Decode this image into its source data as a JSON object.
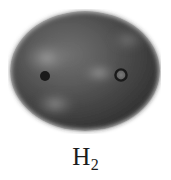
{
  "figure": {
    "caption": "H",
    "caption_subscript": "2",
    "background_color": "#ffffff",
    "label_color": "#1c1c1c"
  },
  "diagram": {
    "type": "electron-density-cloud",
    "title": "H2",
    "shape": "ellipse",
    "shape_center": {
      "x": 85,
      "y": 71
    },
    "shape_radius_x": 77,
    "shape_radius_y": 62,
    "fill_dark_color": "#1a1a1a",
    "fill_mid_color": "#4a4a4a",
    "fill_light_color": "#a8a8a8",
    "edge_softness": "blurred",
    "nuclei": [
      {
        "name": "hydrogen-nucleus-left",
        "label": "H",
        "cx": 45,
        "cy": 76,
        "radius": 5,
        "style": "filled-dot",
        "color": "#000000"
      },
      {
        "name": "hydrogen-nucleus-right",
        "label": "H",
        "cx": 121,
        "cy": 75,
        "radius": 5.5,
        "style": "ring",
        "color": "#000000",
        "inner_color": "#6e6e6e"
      }
    ],
    "highlights": [
      {
        "name": "upper-left-highlight",
        "cx": 47,
        "cy": 58,
        "rx": 22,
        "ry": 15,
        "intensity": "#b4b4b4"
      },
      {
        "name": "central-bond-highlight",
        "cx": 99,
        "cy": 73,
        "rx": 17,
        "ry": 9,
        "intensity": "#b0b0b0"
      },
      {
        "name": "lower-left-highlight",
        "cx": 55,
        "cy": 104,
        "rx": 20,
        "ry": 12,
        "intensity": "#a6a6a6"
      },
      {
        "name": "upper-right-highlight",
        "cx": 128,
        "cy": 40,
        "rx": 18,
        "ry": 11,
        "intensity": "#8e8e8e"
      }
    ]
  }
}
